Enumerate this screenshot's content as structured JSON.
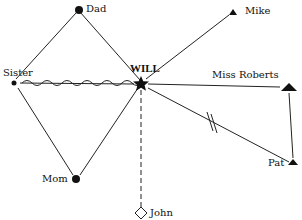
{
  "diagram": {
    "type": "ecomap / relationship diagram",
    "center": {
      "label": "WILL",
      "shape": "star"
    },
    "nodes": [
      {
        "id": "dad",
        "label": "Dad",
        "shape": "filled-circle"
      },
      {
        "id": "sister",
        "label": "Sister",
        "shape": "small-filled-circle"
      },
      {
        "id": "mom",
        "label": "Mom",
        "shape": "filled-circle"
      },
      {
        "id": "john",
        "label": "John",
        "shape": "open-diamond"
      },
      {
        "id": "mike",
        "label": "Mike",
        "shape": "small-filled-triangle"
      },
      {
        "id": "miss_roberts",
        "label": "Miss Roberts",
        "shape": "large-filled-triangle"
      },
      {
        "id": "pat",
        "label": "Pat",
        "shape": "small-filled-triangle"
      }
    ],
    "edges": [
      {
        "from": "will",
        "to": "dad",
        "style": "solid"
      },
      {
        "from": "dad",
        "to": "sister",
        "style": "solid"
      },
      {
        "from": "sister",
        "to": "mom",
        "style": "solid"
      },
      {
        "from": "mom",
        "to": "will",
        "style": "solid"
      },
      {
        "from": "sister",
        "to": "will",
        "style": "wavy (conflict)"
      },
      {
        "from": "will",
        "to": "john",
        "style": "dashed"
      },
      {
        "from": "will",
        "to": "mike",
        "style": "solid"
      },
      {
        "from": "will",
        "to": "miss_roberts",
        "style": "solid"
      },
      {
        "from": "will",
        "to": "pat",
        "style": "solid with double hash (cut-off)"
      },
      {
        "from": "miss_roberts",
        "to": "pat",
        "style": "solid"
      }
    ]
  }
}
